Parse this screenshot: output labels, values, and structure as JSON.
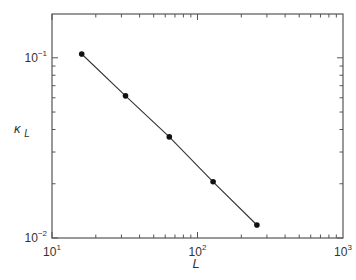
{
  "chart_data": {
    "type": "line",
    "title": "",
    "xlabel": "L",
    "ylabel": "κ_L",
    "xscale": "log",
    "yscale": "log",
    "xlim": [
      10,
      1000
    ],
    "ylim": [
      0.01,
      0.175
    ],
    "grid": false,
    "legend": null,
    "x_ticks": [
      {
        "base": "10",
        "exp": "1",
        "value": 10
      },
      {
        "base": "10",
        "exp": "2",
        "value": 100
      },
      {
        "base": "10",
        "exp": "3",
        "value": 1000
      }
    ],
    "y_ticks": [
      {
        "base": "10",
        "exp": "−2",
        "value": 0.01
      },
      {
        "base": "10",
        "exp": "−1",
        "value": 0.1
      }
    ],
    "series": [
      {
        "name": "kappa_L",
        "marker": "circle",
        "line": "solid",
        "color": "#222222",
        "x": [
          16,
          32,
          64,
          128,
          256
        ],
        "values": [
          0.105,
          0.0615,
          0.0364,
          0.0205,
          0.0118
        ]
      }
    ]
  },
  "labels": {
    "xlabel": "L",
    "ylabel_main": "κ",
    "ylabel_sub": "L"
  },
  "colors": {
    "axis": "#555555",
    "line": "#333333",
    "marker": "#111111"
  }
}
